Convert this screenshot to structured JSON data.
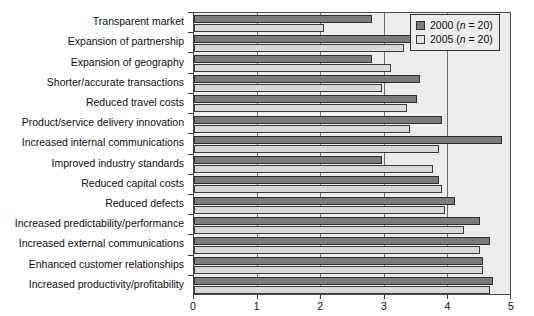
{
  "chart_data": {
    "type": "bar",
    "orientation": "horizontal",
    "title": "",
    "xlabel": "",
    "ylabel": "",
    "xlim": [
      0,
      5
    ],
    "xticks": [
      "0",
      "1",
      "2",
      "3",
      "4",
      "5"
    ],
    "grid": true,
    "legend_position": "top-right",
    "categories": [
      "Transparent market",
      "Expansion of partnership",
      "Expansion of geography",
      "Shorter/accurate transactions",
      "Reduced travel costs",
      "Product/service delivery innovation",
      "Increased internal communications",
      "Improved industry standards",
      "Reduced capital costs",
      "Reduced defects",
      "Increased predictability/performance",
      "Increased external communications",
      "Enhanced customer relationships",
      "Increased productivity/profitability"
    ],
    "series": [
      {
        "name": "2000",
        "legend_label": "2000 (n = 20)",
        "color": "#7b7b7b",
        "values": [
          2.8,
          3.9,
          2.8,
          3.55,
          3.5,
          3.9,
          4.85,
          2.95,
          3.85,
          4.1,
          4.5,
          4.65,
          4.55,
          4.7
        ]
      },
      {
        "name": "2005",
        "legend_label": "2005 (n = 20)",
        "color": "#d9d9d9",
        "values": [
          2.05,
          3.3,
          3.1,
          2.95,
          3.35,
          3.4,
          3.85,
          3.75,
          3.9,
          3.95,
          4.25,
          4.5,
          4.55,
          4.65
        ]
      }
    ]
  },
  "legend": {
    "items": [
      {
        "prefix": "2000 (",
        "ital": "n",
        "suffix": " = 20)"
      },
      {
        "prefix": "2005 (",
        "ital": "n",
        "suffix": " = 20)"
      }
    ]
  }
}
